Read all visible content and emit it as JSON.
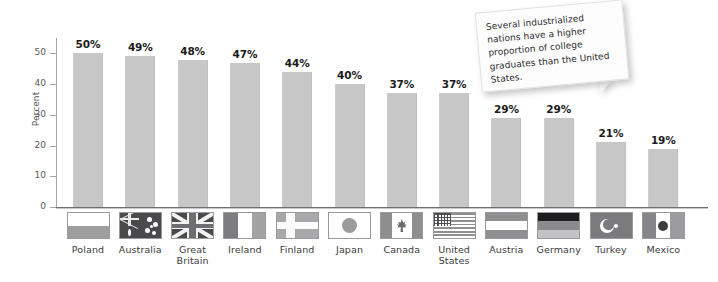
{
  "chart_data": {
    "type": "bar",
    "title": "",
    "xlabel": "",
    "ylabel": "Percent",
    "ylim": [
      0,
      55
    ],
    "yticks": [
      "0",
      "10",
      "20",
      "30",
      "40",
      "50"
    ],
    "grid": false,
    "legend": "none",
    "categories": [
      "Poland",
      "Australia",
      "Great Britain",
      "Ireland",
      "Finland",
      "Japan",
      "Canada",
      "United States",
      "Austria",
      "Germany",
      "Turkey",
      "Mexico"
    ],
    "values": [
      50,
      49,
      48,
      47,
      44,
      40,
      37,
      37,
      29,
      29,
      21,
      19
    ],
    "data_labels": [
      "50%",
      "49%",
      "48%",
      "47%",
      "44%",
      "40%",
      "37%",
      "37%",
      "29%",
      "29%",
      "21%",
      "19%"
    ],
    "annotations": [
      "Several industrialized nations have a higher proportion of college graduates than the United States."
    ],
    "bar_color": "#c7c7c7",
    "axis_color": "#6f6f71",
    "text_color": "#1b1b1b",
    "background": "#ffffff"
  },
  "axis": {
    "y_title": "Percent",
    "y_ticks": [
      {
        "label": "50",
        "value": 50
      },
      {
        "label": "40",
        "value": 40
      },
      {
        "label": "30",
        "value": 30
      },
      {
        "label": "20",
        "value": 20
      },
      {
        "label": "10",
        "value": 10
      },
      {
        "label": "0",
        "value": 0
      }
    ]
  },
  "callout": {
    "text": "Several industrialized nations have a higher proportion of college graduates than the United States."
  },
  "legend": {
    "items": [
      {
        "name": "Poland",
        "line1": "Poland",
        "line2": "",
        "flag": "flag-poland"
      },
      {
        "name": "Australia",
        "line1": "Australia",
        "line2": "",
        "flag": "flag-australia"
      },
      {
        "name": "Great Britain",
        "line1": "Great",
        "line2": "Britain",
        "flag": "flag-great-britain"
      },
      {
        "name": "Ireland",
        "line1": "Ireland",
        "line2": "",
        "flag": "flag-ireland"
      },
      {
        "name": "Finland",
        "line1": "Finland",
        "line2": "",
        "flag": "flag-finland"
      },
      {
        "name": "Japan",
        "line1": "Japan",
        "line2": "",
        "flag": "flag-japan"
      },
      {
        "name": "Canada",
        "line1": "Canada",
        "line2": "",
        "flag": "flag-canada"
      },
      {
        "name": "United States",
        "line1": "United",
        "line2": "States",
        "flag": "flag-united-states"
      },
      {
        "name": "Austria",
        "line1": "Austria",
        "line2": "",
        "flag": "flag-austria"
      },
      {
        "name": "Germany",
        "line1": "Germany",
        "line2": "",
        "flag": "flag-germany"
      },
      {
        "name": "Turkey",
        "line1": "Turkey",
        "line2": "",
        "flag": "flag-turkey"
      },
      {
        "name": "Mexico",
        "line1": "Mexico",
        "line2": "",
        "flag": "flag-mexico"
      }
    ]
  }
}
